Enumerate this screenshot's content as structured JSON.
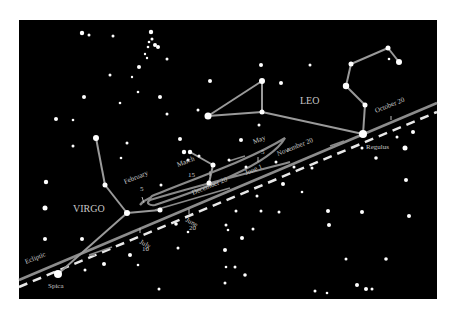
{
  "diagram": {
    "background": "#000000",
    "page_background": "#ffffff",
    "panel": {
      "x": 19,
      "y": 20,
      "w": 418,
      "h": 279
    },
    "colors": {
      "star": "#ffffff",
      "constellation_line": "#9a9a9a",
      "path": "#8a8a8a",
      "ecliptic": "#8c8c8c",
      "dashed_line": "#e8e8e8",
      "label": "#c8c8c8"
    },
    "constellations": [
      {
        "name": "VIRGO",
        "label_x": 73,
        "label_y": 212
      },
      {
        "name": "LEO",
        "label_x": 300,
        "label_y": 104
      }
    ],
    "named_stars": [
      {
        "name": "Spica",
        "x": 58,
        "y": 274,
        "label_x": 48,
        "label_y": 288
      },
      {
        "name": "Regulus",
        "x": 363,
        "y": 134,
        "label_x": 366,
        "label_y": 149
      }
    ],
    "line_labels": [
      {
        "text": "Ecliptic",
        "x": 26,
        "y": 264,
        "angle": -22
      }
    ],
    "date_labels": [
      {
        "text": "February",
        "line2": "5",
        "x": 125,
        "y": 184,
        "angle": -22
      },
      {
        "text": "March",
        "line2": "15",
        "x": 178,
        "y": 167,
        "angle": -22
      },
      {
        "text": "May",
        "line2": "5",
        "x": 254,
        "y": 144,
        "angle": -22
      },
      {
        "text": "November 20",
        "line2": "",
        "x": 278,
        "y": 156,
        "angle": -22
      },
      {
        "text": "October 20",
        "line2": "",
        "x": 376,
        "y": 113,
        "angle": -22
      },
      {
        "text": "December 20",
        "line2": "",
        "x": 193,
        "y": 195,
        "angle": -22
      },
      {
        "text": "June 1",
        "line2": "",
        "x": 246,
        "y": 175,
        "angle": -22
      },
      {
        "text": "June",
        "line2": "20",
        "x": 193,
        "y": 220,
        "angle": 0
      },
      {
        "text": "July",
        "line2": "10",
        "x": 144,
        "y": 240,
        "angle": 0
      }
    ],
    "icons": {
      "star": "filled-circle",
      "direction_arrow": "arrow-left"
    }
  }
}
